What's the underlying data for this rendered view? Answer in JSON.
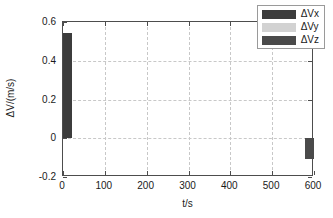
{
  "chart_data": {
    "type": "bar",
    "title": "",
    "xlabel": "t/s",
    "ylabel": "ΔV/(m/s)",
    "xlim": [
      0,
      600
    ],
    "ylim": [
      -0.2,
      0.6
    ],
    "xticks": [
      0,
      100,
      200,
      300,
      400,
      500,
      600
    ],
    "xticklabels": [
      "0",
      "100",
      "200",
      "300",
      "400",
      "500",
      "600"
    ],
    "yticks": [
      -0.2,
      0,
      0.2,
      0.4,
      0.6
    ],
    "yticklabels": [
      "-0.2",
      "0",
      "0.2",
      "0.4",
      "0.6"
    ],
    "grid": true,
    "grid_style": "dashed",
    "grid_color": "#c8c8c8",
    "legend_position": "upper right",
    "series": [
      {
        "name": "ΔVx",
        "color": "#3c3c3c",
        "x": [
          5
        ],
        "values": [
          0.545
        ]
      },
      {
        "name": "ΔVy",
        "color": "#d2d2d2",
        "x": [],
        "values": []
      },
      {
        "name": "ΔVz",
        "color": "#4a4a4a",
        "x": [
          595
        ],
        "values": [
          -0.105
        ]
      }
    ],
    "bars": [
      {
        "series": "ΔVx",
        "x": 5,
        "value": 0.545,
        "color": "#3c3c3c"
      },
      {
        "series": "ΔVz",
        "x": 595,
        "value": -0.105,
        "color": "#4a4a4a"
      }
    ]
  },
  "legend": {
    "items": [
      {
        "label": "ΔVx",
        "color": "#3c3c3c"
      },
      {
        "label": "ΔVy",
        "color": "#d2d2d2"
      },
      {
        "label": "ΔVz",
        "color": "#4a4a4a"
      }
    ]
  },
  "axes": {
    "frame_color": "#4d4d4d",
    "background": "#ffffff"
  }
}
